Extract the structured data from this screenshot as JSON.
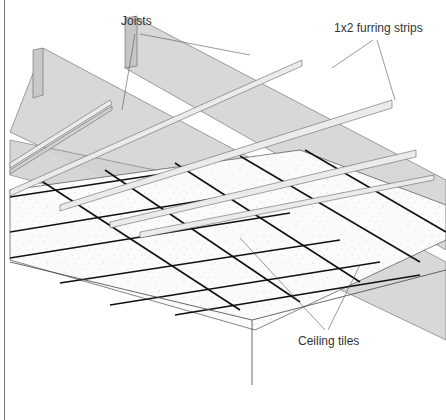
{
  "diagram": {
    "type": "isometric-construction-illustration",
    "labels": {
      "joists": "Joists",
      "furring": "1x2 furring strips",
      "tiles": "Ceiling tiles"
    },
    "components": [
      {
        "name": "joists",
        "count": 2,
        "color": "#d9d9d9",
        "orientation": "upper-left to lower-right"
      },
      {
        "name": "furring-strips",
        "count": 5,
        "color": "#e6e6e6",
        "orientation": "lower-left to upper-right"
      },
      {
        "name": "ceiling-tiles",
        "grid": "4x4+",
        "color": "#ffffff",
        "grid_line_color": "#111111"
      },
      {
        "name": "wall-corner",
        "color": "#444444"
      }
    ],
    "colors": {
      "background": "#ffffff",
      "joist_fill": "#d6d6d6",
      "joist_end": "#c8c8c8",
      "strip_fill": "#e8e8e8",
      "outline": "#555555",
      "grid": "#111111",
      "leader": "#555555"
    }
  }
}
